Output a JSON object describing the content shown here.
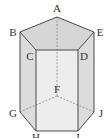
{
  "diagram": {
    "type": "pentagonal-prism",
    "vertices": {
      "A": {
        "x": 57,
        "y": 17
      },
      "B": {
        "x": 20,
        "y": 32
      },
      "C": {
        "x": 36,
        "y": 50
      },
      "D": {
        "x": 78,
        "y": 50
      },
      "E": {
        "x": 94,
        "y": 32
      },
      "F": {
        "x": 57,
        "y": 96
      },
      "G": {
        "x": 20,
        "y": 112
      },
      "H": {
        "x": 36,
        "y": 131
      },
      "I": {
        "x": 78,
        "y": 131
      },
      "J": {
        "x": 94,
        "y": 112
      }
    },
    "labels": {
      "A": "A",
      "B": "B",
      "C": "C",
      "D": "D",
      "E": "E",
      "F": "F",
      "G": "G",
      "H": "H",
      "I": "I",
      "J": "J"
    },
    "hidden_edges": [
      "A-F",
      "F-G",
      "F-J"
    ],
    "colors": {
      "edge": "#555555",
      "hidden_edge": "#888888",
      "top_face": "#d9d9d9",
      "front_face": "#ececec",
      "side_face": "#dedede"
    }
  }
}
